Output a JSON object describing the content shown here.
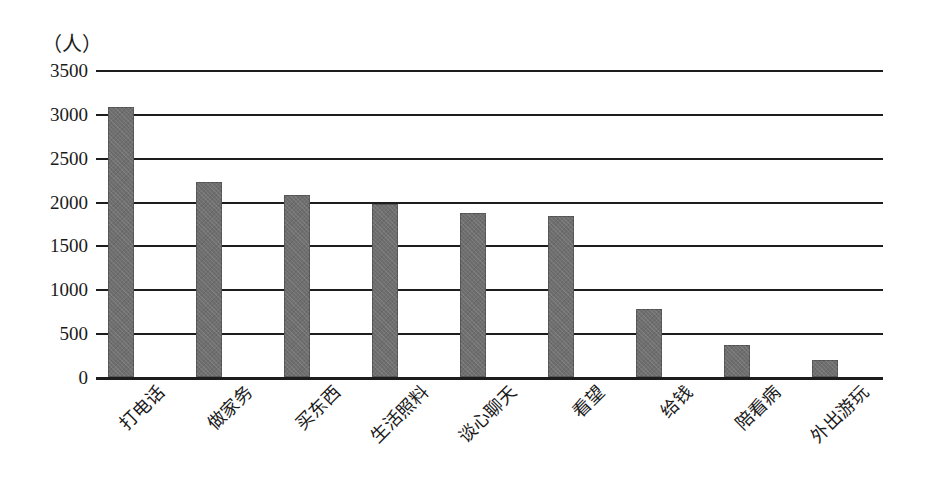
{
  "chart_data": {
    "type": "bar",
    "title": "",
    "xlabel": "",
    "ylabel": "（人）",
    "ylim": [
      0,
      3500
    ],
    "ytick_step": 500,
    "yticks": [
      "3500",
      "3000",
      "2500",
      "2000",
      "1500",
      "1000",
      "500",
      "0"
    ],
    "grid": true,
    "legend": "none",
    "bar_color": "#6f6f6f",
    "axis_color": "#1d1d1d",
    "categories": [
      "打电话",
      "做家务",
      "买东西",
      "生活照料",
      "谈心聊天",
      "看望",
      "给钱",
      "陪看病",
      "外出游玩"
    ],
    "values": [
      3075,
      2220,
      2070,
      1970,
      1870,
      1830,
      780,
      370,
      195
    ],
    "series": [
      {
        "name": "人数",
        "values": [
          3075,
          2220,
          2070,
          1970,
          1870,
          1830,
          780,
          370,
          195
        ]
      }
    ]
  }
}
